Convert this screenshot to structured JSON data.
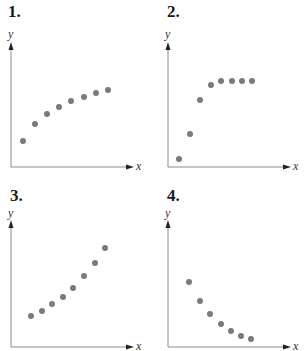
{
  "colors": {
    "axis": "#8a8a8a",
    "arrow": "#222222",
    "dot": "#7a7a7a",
    "label": "#1a1a1a"
  },
  "chart_data": [
    {
      "type": "scatter",
      "title": "1.",
      "xlabel": "x",
      "ylabel": "y",
      "grid": false,
      "description": "increasing, concave down (decelerating growth)",
      "points_px": [
        [
          23,
          141
        ],
        [
          35,
          124
        ],
        [
          47,
          114
        ],
        [
          59,
          107
        ],
        [
          71,
          101
        ],
        [
          84,
          97
        ],
        [
          96,
          93
        ],
        [
          108,
          90
        ]
      ],
      "x": [
        1,
        2,
        3,
        4,
        5,
        6,
        7,
        8
      ],
      "y": [
        2.6,
        4.3,
        5.3,
        6.0,
        6.6,
        7.0,
        7.4,
        7.7
      ]
    },
    {
      "type": "scatter",
      "title": "2.",
      "xlabel": "x",
      "ylabel": "y",
      "grid": false,
      "description": "rapid increase then leveling off (logistic / saturation)",
      "points_px": [
        [
          179,
          159
        ],
        [
          190,
          134
        ],
        [
          200,
          100
        ],
        [
          211,
          85
        ],
        [
          221,
          81
        ],
        [
          232,
          81
        ],
        [
          242,
          81
        ],
        [
          252,
          81
        ]
      ],
      "x": [
        1,
        2,
        3,
        4,
        5,
        6,
        7,
        8
      ],
      "y": [
        0.8,
        3.3,
        6.7,
        8.2,
        8.6,
        8.6,
        8.6,
        8.6
      ]
    },
    {
      "type": "scatter",
      "title": "3.",
      "xlabel": "x",
      "ylabel": "y",
      "grid": false,
      "description": "increasing, concave up (exponential growth)",
      "points_px": [
        [
          31,
          316
        ],
        [
          42,
          311
        ],
        [
          52,
          304
        ],
        [
          63,
          297
        ],
        [
          73,
          288
        ],
        [
          84,
          276
        ],
        [
          95,
          263
        ],
        [
          105,
          248
        ]
      ],
      "x": [
        1,
        2,
        3,
        4,
        5,
        6,
        7,
        8
      ],
      "y": [
        3.1,
        3.6,
        4.3,
        5.0,
        5.9,
        7.1,
        8.4,
        9.9
      ]
    },
    {
      "type": "scatter",
      "title": "4.",
      "xlabel": "x",
      "ylabel": "y",
      "grid": false,
      "description": "decreasing, concave up (exponential decay)",
      "points_px": [
        [
          189,
          282
        ],
        [
          200,
          301
        ],
        [
          210,
          314
        ],
        [
          221,
          324
        ],
        [
          231,
          331
        ],
        [
          241,
          336
        ],
        [
          251,
          339
        ]
      ],
      "x": [
        1,
        2,
        3,
        4,
        5,
        6,
        7
      ],
      "y": [
        6.5,
        4.6,
        3.3,
        2.3,
        1.6,
        1.1,
        0.8
      ]
    }
  ],
  "panels": [
    {
      "label": "1.",
      "ylabel": "y",
      "xlabel": "x",
      "label_pos": [
        8,
        3
      ],
      "ylabel_pos": [
        8,
        28
      ],
      "xlabel_pos": [
        136,
        160
      ],
      "yaxis": {
        "x": 11,
        "top": 42,
        "bottom": 167
      },
      "xaxis": {
        "y": 167,
        "left": 11,
        "right": 134
      }
    },
    {
      "label": "2.",
      "ylabel": "y",
      "xlabel": "x",
      "label_pos": [
        167,
        3
      ],
      "ylabel_pos": [
        165,
        28
      ],
      "xlabel_pos": [
        293,
        160
      ],
      "yaxis": {
        "x": 168,
        "top": 42,
        "bottom": 167
      },
      "xaxis": {
        "y": 167,
        "left": 168,
        "right": 291
      }
    },
    {
      "label": "3.",
      "ylabel": "y",
      "xlabel": "x",
      "label_pos": [
        10,
        187
      ],
      "ylabel_pos": [
        8,
        207
      ],
      "xlabel_pos": [
        136,
        340
      ],
      "yaxis": {
        "x": 11,
        "top": 220,
        "bottom": 347
      },
      "xaxis": {
        "y": 347,
        "left": 11,
        "right": 134
      }
    },
    {
      "label": "4.",
      "ylabel": "y",
      "xlabel": "x",
      "label_pos": [
        167,
        187
      ],
      "ylabel_pos": [
        165,
        207
      ],
      "xlabel_pos": [
        293,
        340
      ],
      "yaxis": {
        "x": 168,
        "top": 220,
        "bottom": 347
      },
      "xaxis": {
        "y": 347,
        "left": 168,
        "right": 291
      }
    }
  ]
}
